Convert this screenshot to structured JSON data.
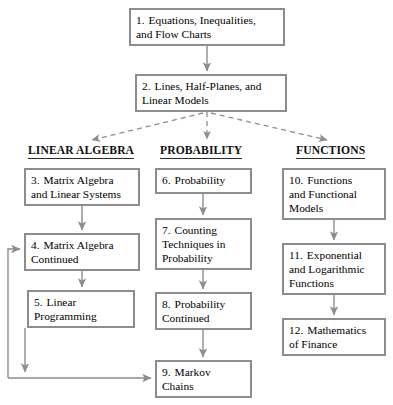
{
  "diagram": {
    "colors": {
      "box_border": "#8d8d8d",
      "solid_arrow": "#8d8d8d",
      "dashed_arrow": "#8d8d8d",
      "text": "#000000",
      "heading_text": "#111111",
      "background": "#ffffff"
    },
    "headings": [
      {
        "name": "linear-algebra",
        "label": "LINEAR ALGEBRA",
        "x": 28,
        "y": 144,
        "width": 120
      },
      {
        "name": "probability",
        "label": "PROBABILITY",
        "x": 160,
        "y": 144,
        "width": 92
      },
      {
        "name": "functions",
        "label": "FUNCTIONS",
        "x": 296,
        "y": 144,
        "width": 83
      }
    ],
    "nodes": [
      {
        "id": "ch1",
        "number": "1.",
        "lines": [
          "Equations, Inequalities,",
          "and Flow Charts"
        ],
        "x": 129,
        "y": 8,
        "w": 156,
        "h": 38
      },
      {
        "id": "ch2",
        "number": "2.",
        "lines": [
          "Lines, Half-Planes, and",
          "Linear Models"
        ],
        "x": 135,
        "y": 74,
        "w": 152,
        "h": 38
      },
      {
        "id": "ch3",
        "number": "3.",
        "lines": [
          "Matrix Algebra",
          "and Linear Systems"
        ],
        "x": 24,
        "y": 168,
        "w": 116,
        "h": 38
      },
      {
        "id": "ch4",
        "number": "4.",
        "lines": [
          "Matrix Algebra",
          "Continued"
        ],
        "x": 24,
        "y": 233,
        "w": 116,
        "h": 38
      },
      {
        "id": "ch5",
        "number": "5.",
        "lines": [
          "Linear",
          "Programming"
        ],
        "x": 27,
        "y": 290,
        "w": 108,
        "h": 38
      },
      {
        "id": "ch6",
        "number": "6.",
        "lines": [
          "Probability"
        ],
        "x": 155,
        "y": 168,
        "w": 97,
        "h": 26
      },
      {
        "id": "ch7",
        "number": "7.",
        "lines": [
          "Counting",
          "Techniques in",
          "Probability"
        ],
        "x": 155,
        "y": 218,
        "w": 97,
        "h": 52
      },
      {
        "id": "ch8",
        "number": "8.",
        "lines": [
          "Probability",
          "Continued"
        ],
        "x": 155,
        "y": 292,
        "w": 97,
        "h": 38
      },
      {
        "id": "ch9",
        "number": "9.",
        "lines": [
          "Markov",
          "Chains"
        ],
        "x": 155,
        "y": 360,
        "w": 97,
        "h": 38
      },
      {
        "id": "ch10",
        "number": "10.",
        "lines": [
          "Functions",
          "and Functional",
          "Models"
        ],
        "x": 282,
        "y": 168,
        "w": 104,
        "h": 52
      },
      {
        "id": "ch11",
        "number": "11.",
        "lines": [
          "Exponential",
          "and Logarithmic",
          "Functions"
        ],
        "x": 282,
        "y": 243,
        "w": 104,
        "h": 52
      },
      {
        "id": "ch12",
        "number": "12.",
        "lines": [
          "Mathematics",
          "of Finance"
        ],
        "x": 282,
        "y": 318,
        "w": 104,
        "h": 38
      }
    ],
    "connectors": [
      {
        "name": "arrow-ch1-to-ch2",
        "style": "solid",
        "from": "ch1",
        "to": "ch2"
      },
      {
        "name": "arrow-ch2-to-linear-algebra",
        "style": "dashed",
        "from": "ch2",
        "to": "linear-algebra-heading"
      },
      {
        "name": "arrow-ch2-to-probability",
        "style": "dashed",
        "from": "ch2",
        "to": "probability-heading"
      },
      {
        "name": "arrow-ch2-to-functions",
        "style": "dashed",
        "from": "ch2",
        "to": "functions-heading"
      },
      {
        "name": "arrow-ch3-to-ch4",
        "style": "solid",
        "from": "ch3",
        "to": "ch4"
      },
      {
        "name": "arrow-ch4-to-ch5",
        "style": "solid",
        "from": "ch4",
        "to": "ch5"
      },
      {
        "name": "arrow-loop-into-ch4",
        "style": "solid",
        "from": "feedback-line",
        "to": "ch4"
      },
      {
        "name": "arrow-ch5-down-to-bus",
        "style": "solid",
        "from": "ch5",
        "to": "bottom-bus"
      },
      {
        "name": "arrow-bus-to-ch9",
        "style": "solid",
        "from": "bottom-bus",
        "to": "ch9"
      },
      {
        "name": "arrow-ch6-to-ch7",
        "style": "solid",
        "from": "ch6",
        "to": "ch7"
      },
      {
        "name": "arrow-ch7-to-ch8",
        "style": "solid",
        "from": "ch7",
        "to": "ch8"
      },
      {
        "name": "arrow-ch8-to-ch9",
        "style": "solid",
        "from": "ch8",
        "to": "ch9"
      },
      {
        "name": "arrow-ch10-to-ch11",
        "style": "solid",
        "from": "ch10",
        "to": "ch11"
      },
      {
        "name": "arrow-ch11-to-ch12",
        "style": "solid",
        "from": "ch11",
        "to": "ch12"
      }
    ]
  }
}
